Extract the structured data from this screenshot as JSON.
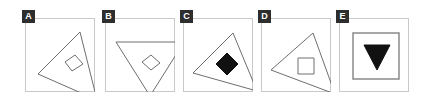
{
  "canvas": {
    "width": 440,
    "height": 99,
    "background": "#ffffff"
  },
  "style": {
    "panel_border_color": "#c9c9c9",
    "badge_background": "#2e2e2e",
    "badge_text_color": "#ffffff",
    "outline_stroke_color": "#6e6e6e",
    "fill_color": "#111111",
    "square_border_color": "#8a8a8a"
  },
  "panels": [
    {
      "label": "A",
      "name": "panel-a",
      "x": 25,
      "y": 18,
      "width": 70,
      "height": 74,
      "outer_shape": "triangle-tilted",
      "inner_shape": "diamond-outline",
      "inner_filled": false,
      "outer_points": "13,56 55,14 72,82",
      "inner_points": "40,44 50,37 58,46 47,53"
    },
    {
      "label": "B",
      "name": "panel-b",
      "x": 105,
      "y": 18,
      "width": 70,
      "height": 74,
      "outer_shape": "triangle-inverted",
      "inner_shape": "diamond-outline",
      "inner_filled": false,
      "outer_points": "11,24 79,24 45,78",
      "inner_points": "37,44 46,37 55,45 46,52"
    },
    {
      "label": "C",
      "name": "panel-c",
      "x": 183,
      "y": 18,
      "width": 70,
      "height": 74,
      "outer_shape": "triangle-tilted",
      "inner_shape": "diamond-filled",
      "inner_filled": true,
      "outer_points": "10,55 50,15 74,73",
      "inner_points": "33,46 44,35 55,46 44,57"
    },
    {
      "label": "D",
      "name": "panel-d",
      "x": 261,
      "y": 18,
      "width": 70,
      "height": 74,
      "outer_shape": "triangle-tilted",
      "inner_shape": "square-outline",
      "inner_filled": false,
      "outer_points": "10,52 52,15 74,76",
      "inner_points": "37,40 53,40 53,56 37,56"
    },
    {
      "label": "E",
      "name": "panel-e",
      "x": 339,
      "y": 18,
      "width": 70,
      "height": 74,
      "outer_shape": "square-outline",
      "inner_shape": "triangle-filled-down",
      "inner_filled": true,
      "outer_points": "14,15 60,15 60,61 14,61",
      "inner_points": "25,27 51,27 38,52"
    }
  ]
}
